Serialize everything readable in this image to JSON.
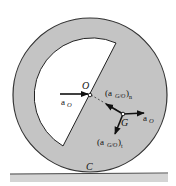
{
  "diagram": {
    "type": "rolling-wheel-kinematics",
    "colors": {
      "wheel_fill": "#c4c4c4",
      "cutout_fill": "#ffffff",
      "outline": "#333333",
      "ground_strip": "#d4d4d4",
      "ground_line": "#444444",
      "arrow": "#111111"
    },
    "points": {
      "center": "O",
      "mass_center": "G",
      "contact": "C"
    },
    "labels": {
      "O": "O",
      "G": "G",
      "C": "C",
      "aO_left_main": "a",
      "aO_left_sub": "O",
      "aO_right_main": "a",
      "aO_right_sub": "O",
      "aGOn_open": "(a",
      "aGOn_sub": "G/O",
      "aGOn_close": ")",
      "aGOn_post": "n",
      "aGOt_open": "(a",
      "aGOt_sub": "G/O",
      "aGOt_close": ")",
      "aGOt_post": "t"
    },
    "vectors": [
      {
        "name": "a_O at O",
        "direction": "right"
      },
      {
        "name": "(a_G/O)_n",
        "direction": "toward O"
      },
      {
        "name": "a_O at G",
        "direction": "right"
      },
      {
        "name": "(a_G/O)_t",
        "direction": "perpendicular to OG"
      }
    ]
  }
}
